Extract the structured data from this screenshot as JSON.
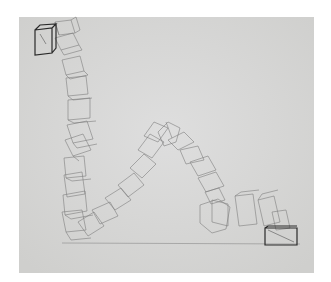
{
  "artwork": {
    "subject": "pencil drawing of a chain of tumbling cubes",
    "colors": {
      "background": "#ffffff",
      "paper": "#dadad8",
      "line_light": "#8a8a8a",
      "line_dark": "#2a2a2a"
    },
    "paper_rect": {
      "x": 19,
      "y": 17,
      "width": 295,
      "height": 256
    }
  }
}
